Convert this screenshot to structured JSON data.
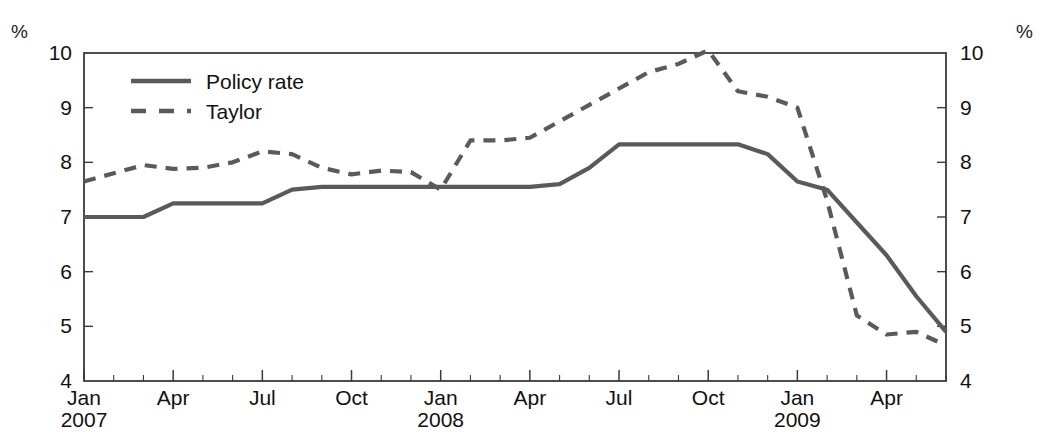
{
  "axis_labels": {
    "left_unit": "%",
    "right_unit": "%"
  },
  "legend": {
    "items": [
      {
        "label": "Policy rate",
        "style": "solid",
        "color": "#5a5a5a"
      },
      {
        "label": "Taylor",
        "style": "dashed",
        "color": "#5a5a5a"
      }
    ]
  },
  "chart_data": {
    "type": "line",
    "title": "",
    "subtitle": "",
    "xlabel": "",
    "ylabel": "%",
    "y2label": "%",
    "ylim": [
      4,
      10
    ],
    "y2lim": [
      4,
      10
    ],
    "yticks": [
      4,
      5,
      6,
      7,
      8,
      9,
      10
    ],
    "y2ticks": [
      4,
      5,
      6,
      7,
      8,
      9,
      10
    ],
    "grid": false,
    "legend_position": "top-left",
    "line_color": "#5a5a5a",
    "x_tick_labels": [
      {
        "x": "2007-01",
        "label": "Jan",
        "year": "2007"
      },
      {
        "x": "2007-04",
        "label": "Apr",
        "year": ""
      },
      {
        "x": "2007-07",
        "label": "Jul",
        "year": ""
      },
      {
        "x": "2007-10",
        "label": "Oct",
        "year": ""
      },
      {
        "x": "2008-01",
        "label": "Jan",
        "year": "2008"
      },
      {
        "x": "2008-04",
        "label": "Apr",
        "year": ""
      },
      {
        "x": "2008-07",
        "label": "Jul",
        "year": ""
      },
      {
        "x": "2008-10",
        "label": "Oct",
        "year": ""
      },
      {
        "x": "2009-01",
        "label": "Jan",
        "year": "2009"
      },
      {
        "x": "2009-04",
        "label": "Apr",
        "year": ""
      }
    ],
    "x": [
      "2007-01",
      "2007-02",
      "2007-03",
      "2007-04",
      "2007-05",
      "2007-06",
      "2007-07",
      "2007-08",
      "2007-09",
      "2007-10",
      "2007-11",
      "2007-12",
      "2008-01",
      "2008-02",
      "2008-03",
      "2008-04",
      "2008-05",
      "2008-06",
      "2008-07",
      "2008-08",
      "2008-09",
      "2008-10",
      "2008-11",
      "2008-12",
      "2009-01",
      "2009-02",
      "2009-03",
      "2009-04",
      "2009-05",
      "2009-06"
    ],
    "series": [
      {
        "name": "Policy rate",
        "style": "solid",
        "values": [
          7.0,
          7.0,
          7.0,
          7.25,
          7.25,
          7.25,
          7.25,
          7.5,
          7.55,
          7.55,
          7.55,
          7.55,
          7.55,
          7.55,
          7.55,
          7.55,
          7.6,
          7.9,
          8.33,
          8.33,
          8.33,
          8.33,
          8.33,
          8.15,
          7.65,
          7.5,
          6.9,
          6.3,
          5.55,
          4.9
        ]
      },
      {
        "name": "Taylor",
        "style": "dashed",
        "values": [
          7.65,
          7.8,
          7.95,
          7.88,
          7.9,
          8.0,
          8.2,
          8.15,
          7.9,
          7.78,
          7.85,
          7.82,
          7.5,
          8.4,
          8.4,
          8.45,
          8.75,
          9.05,
          9.35,
          9.65,
          9.8,
          10.05,
          9.3,
          9.2,
          9.0,
          7.3,
          5.2,
          4.85,
          4.9,
          4.65
        ]
      }
    ],
    "annotations": [
      {
        "text": "Taylor rate peaks at about 10.05 around Oct 2008",
        "type": "note"
      },
      {
        "text": "Policy rate plateaus at about 8.33 from Jul 2008 to Nov 2008",
        "type": "note"
      },
      {
        "text": "Policy rate starts flat at 7.00 in early 2007",
        "type": "note"
      }
    ]
  }
}
